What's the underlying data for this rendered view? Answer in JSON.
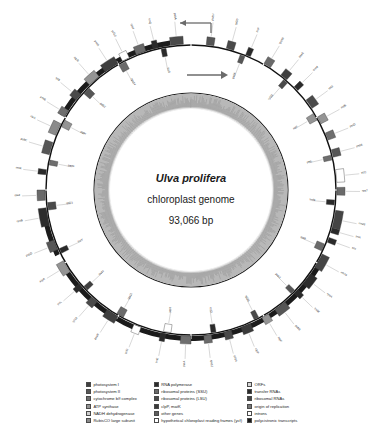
{
  "figure": {
    "type": "circular-genome-map",
    "organism": "Ulva prolifera",
    "subtitle": "chloroplast genome",
    "size": "93,066 bp",
    "background": "#ffffff"
  },
  "chart_data": {
    "type": "circular_genome_map",
    "genome_length_bp": 93066,
    "rings": [
      {
        "name": "gene-ring",
        "radius": 145,
        "description": "genes drawn outside (forward strand) and inside (reverse strand) of the backbone circle"
      },
      {
        "name": "gc-content-ring",
        "radius": 96,
        "description": "inner grey histogram of GC content"
      }
    ],
    "transcription_arrows": [
      {
        "direction": "counterclockwise",
        "position": "top-left"
      },
      {
        "direction": "clockwise",
        "position": "top-right"
      }
    ],
    "polycistronic_band": {
      "color": "#1b1b1b",
      "arc": "bottom of circle"
    }
  },
  "center": {
    "species": "Ulva prolifera",
    "genome": "chloroplast genome",
    "length": "93,066 bp"
  },
  "legend": {
    "columns": [
      {
        "items": [
          {
            "label": "photosystem I",
            "color": "#3f3f3f"
          },
          {
            "label": "photosystem II",
            "color": "#565656"
          },
          {
            "label": "cytochrome b/f complex",
            "color": "#6e6e6e"
          },
          {
            "label": "ATP synthase",
            "color": "#949494"
          },
          {
            "label": "NADH dehydrogenase",
            "color": "#cfcfcf"
          },
          {
            "label": "RubisCO large subunit",
            "color": "#8a8a8a"
          }
        ]
      },
      {
        "items": [
          {
            "label": "RNA polymerase",
            "color": "#2c2c2c"
          },
          {
            "label": "ribosomal proteins (SSU)",
            "color": "#6a6a6a"
          },
          {
            "label": "ribosomal proteins (LSU)",
            "color": "#4a4a4a"
          },
          {
            "label": "clpP, matK",
            "color": "#3a3a3a"
          },
          {
            "label": "other genes",
            "color": "#5d5d5d"
          },
          {
            "label": "hypothetical chloroplast reading frames (ycf)",
            "color": "#ffffff"
          }
        ]
      },
      {
        "items": [
          {
            "label": "ORFs",
            "color": "#d8d8d8"
          },
          {
            "label": "transfer RNAs",
            "color": "#2a2a2a"
          },
          {
            "label": "ribosomal RNAs",
            "color": "#454545"
          },
          {
            "label": "origin of replication",
            "color": "#787878"
          },
          {
            "label": "introns",
            "color": "#ffffff"
          },
          {
            "label": "polycistronic transcripts",
            "color": "#1b1b1b"
          }
        ]
      }
    ]
  },
  "genes": {
    "outer": [
      {
        "label": "psbA",
        "angle": 352,
        "span": 5,
        "shade": "#4a4a4a"
      },
      {
        "label": "trnQ",
        "angle": 345,
        "span": 2,
        "shade": "#2a2a2a"
      },
      {
        "label": "rps4",
        "angle": 338,
        "span": 4,
        "shade": "#6a6a6a"
      },
      {
        "label": "ycf12",
        "angle": 332,
        "span": 3,
        "shade": "#ffffff"
      },
      {
        "label": "psaA",
        "angle": 324,
        "span": 6,
        "shade": "#3f3f3f"
      },
      {
        "label": "atpB",
        "angle": 316,
        "span": 5,
        "shade": "#949494"
      },
      {
        "label": "rpl5",
        "angle": 308,
        "span": 3,
        "shade": "#4a4a4a"
      },
      {
        "label": "petB",
        "angle": 300,
        "span": 3,
        "shade": "#6e6e6e"
      },
      {
        "label": "rbcL",
        "angle": 292,
        "span": 5,
        "shade": "#8a8a8a"
      },
      {
        "label": "psbC",
        "angle": 284,
        "span": 5,
        "shade": "#565656"
      },
      {
        "label": "trnR",
        "angle": 276,
        "span": 2,
        "shade": "#2a2a2a"
      },
      {
        "label": "rps2",
        "angle": 266,
        "span": 4,
        "shade": "#6a6a6a"
      },
      {
        "label": "rpoB",
        "angle": 256,
        "span": 7,
        "shade": "#2c2c2c"
      },
      {
        "label": "psbD",
        "angle": 246,
        "span": 4,
        "shade": "#565656"
      },
      {
        "label": "atpA",
        "angle": 236,
        "span": 5,
        "shade": "#949494"
      },
      {
        "label": "trnL",
        "angle": 228,
        "span": 2,
        "shade": "#2a2a2a"
      },
      {
        "label": "rpl16",
        "angle": 220,
        "span": 3,
        "shade": "#4a4a4a"
      },
      {
        "label": "psaB",
        "angle": 210,
        "span": 5,
        "shade": "#3f3f3f"
      },
      {
        "label": "ycf3",
        "angle": 200,
        "span": 3,
        "shade": "#ffffff"
      },
      {
        "label": "trnE",
        "angle": 190,
        "span": 2,
        "shade": "#2a2a2a"
      },
      {
        "label": "petA",
        "angle": 180,
        "span": 4,
        "shade": "#6e6e6e"
      },
      {
        "label": "rps12",
        "angle": 172,
        "span": 3,
        "shade": "#6a6a6a"
      },
      {
        "label": "rpl14",
        "angle": 164,
        "span": 3,
        "shade": "#4a4a4a"
      },
      {
        "label": "clpP",
        "angle": 156,
        "span": 4,
        "shade": "#3a3a3a"
      },
      {
        "label": "atpF",
        "angle": 148,
        "span": 3,
        "shade": "#949494"
      },
      {
        "label": "psbB",
        "angle": 140,
        "span": 5,
        "shade": "#565656"
      },
      {
        "label": "trnW",
        "angle": 133,
        "span": 2,
        "shade": "#2a2a2a"
      },
      {
        "label": "rpoA",
        "angle": 125,
        "span": 5,
        "shade": "#2c2c2c"
      },
      {
        "label": "rrn16",
        "angle": 116,
        "span": 6,
        "shade": "#454545"
      },
      {
        "label": "trnI",
        "angle": 109,
        "span": 2,
        "shade": "#2a2a2a"
      },
      {
        "label": "trnA",
        "angle": 105,
        "span": 2,
        "shade": "#2a2a2a"
      },
      {
        "label": "rrn23",
        "angle": 98,
        "span": 7,
        "shade": "#454545"
      },
      {
        "label": "rps7",
        "angle": 89,
        "span": 3,
        "shade": "#6a6a6a"
      },
      {
        "label": "ycf1",
        "angle": 82,
        "span": 5,
        "shade": "#ffffff"
      },
      {
        "label": "psbE",
        "angle": 74,
        "span": 3,
        "shade": "#565656"
      },
      {
        "label": "petD",
        "angle": 67,
        "span": 3,
        "shade": "#6e6e6e"
      },
      {
        "label": "atpE",
        "angle": 60,
        "span": 3,
        "shade": "#949494"
      },
      {
        "label": "rpl2",
        "angle": 52,
        "span": 4,
        "shade": "#4a4a4a"
      },
      {
        "label": "trnM",
        "angle": 45,
        "span": 2,
        "shade": "#2a2a2a"
      },
      {
        "label": "psaC",
        "angle": 38,
        "span": 3,
        "shade": "#3f3f3f"
      },
      {
        "label": "rps18",
        "angle": 30,
        "span": 3,
        "shade": "#6a6a6a"
      },
      {
        "label": "trnF",
        "angle": 22,
        "span": 2,
        "shade": "#2a2a2a"
      },
      {
        "label": "rpl20",
        "angle": 14,
        "span": 3,
        "shade": "#4a4a4a"
      },
      {
        "label": "psbH",
        "angle": 6,
        "span": 3,
        "shade": "#565656"
      }
    ],
    "inner": [
      {
        "label": "trnG",
        "angle": 348,
        "span": 2,
        "shade": "#2a2a2a"
      },
      {
        "label": "rps14",
        "angle": 330,
        "span": 3,
        "shade": "#6a6a6a"
      },
      {
        "label": "psbZ",
        "angle": 312,
        "span": 3,
        "shade": "#565656"
      },
      {
        "label": "atpH",
        "angle": 296,
        "span": 3,
        "shade": "#949494"
      },
      {
        "label": "petG",
        "angle": 280,
        "span": 2,
        "shade": "#6e6e6e"
      },
      {
        "label": "rpl23",
        "angle": 262,
        "span": 3,
        "shade": "#4a4a4a"
      },
      {
        "label": "trnY",
        "angle": 244,
        "span": 2,
        "shade": "#2a2a2a"
      },
      {
        "label": "psaJ",
        "angle": 226,
        "span": 2,
        "shade": "#3f3f3f"
      },
      {
        "label": "rps11",
        "angle": 208,
        "span": 3,
        "shade": "#6a6a6a"
      },
      {
        "label": "ycf4",
        "angle": 188,
        "span": 3,
        "shade": "#ffffff"
      },
      {
        "label": "trnD",
        "angle": 170,
        "span": 2,
        "shade": "#2a2a2a"
      },
      {
        "label": "rpl36",
        "angle": 152,
        "span": 2,
        "shade": "#4a4a4a"
      },
      {
        "label": "psbJ",
        "angle": 134,
        "span": 2,
        "shade": "#565656"
      },
      {
        "label": "rps9",
        "angle": 112,
        "span": 3,
        "shade": "#6a6a6a"
      },
      {
        "label": "trnN",
        "angle": 94,
        "span": 2,
        "shade": "#2a2a2a"
      },
      {
        "label": "petL",
        "angle": 76,
        "span": 2,
        "shade": "#6e6e6e"
      },
      {
        "label": "atpI",
        "angle": 58,
        "span": 3,
        "shade": "#949494"
      },
      {
        "label": "rpl33",
        "angle": 40,
        "span": 2,
        "shade": "#4a4a4a"
      },
      {
        "label": "psbK",
        "angle": 20,
        "span": 2,
        "shade": "#565656"
      }
    ]
  }
}
